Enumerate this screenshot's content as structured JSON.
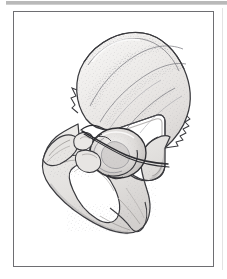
{
  "figure": {
    "kind": "anatomical-line-drawing",
    "caption": "",
    "label": "",
    "frame": {
      "border_color": "#6e6e72",
      "background": "#ffffff",
      "x": 13,
      "y": 11,
      "width": 201,
      "height": 256
    },
    "artifacts": {
      "top_rule_color": "#b9b9b9",
      "right_edge_line_color": "#e3e3e3"
    },
    "palette": {
      "outline": "#3a3a3e",
      "stipple": "#9a9a9f",
      "shade_light": "#f2f1f0",
      "shade_mid": "#e0dedd",
      "shade_dark": "#c6c3c1",
      "highlight": "#ffffff",
      "wire": "#2d2d31"
    },
    "parts": [
      {
        "name": "iliac-crest",
        "label": ""
      },
      {
        "name": "ilium-wing",
        "label": ""
      },
      {
        "name": "anterior-superior-iliac-spine",
        "label": ""
      },
      {
        "name": "anterior-inferior-iliac-spine",
        "label": ""
      },
      {
        "name": "posterior-iliac-border",
        "label": ""
      },
      {
        "name": "greater-sciatic-notch",
        "label": ""
      },
      {
        "name": "acetabulum",
        "label": ""
      },
      {
        "name": "lunate-surface",
        "label": ""
      },
      {
        "name": "acetabular-fossa",
        "label": ""
      },
      {
        "name": "superior-pubic-ramus",
        "label": ""
      },
      {
        "name": "pubic-body",
        "label": ""
      },
      {
        "name": "obturator-foramen",
        "label": ""
      },
      {
        "name": "inferior-pubic-ramus",
        "label": ""
      },
      {
        "name": "ischial-ramus",
        "label": ""
      },
      {
        "name": "ischial-tuberosity",
        "label": ""
      },
      {
        "name": "ischial-spine",
        "label": ""
      },
      {
        "name": "measurement-wire",
        "label": ""
      }
    ]
  }
}
